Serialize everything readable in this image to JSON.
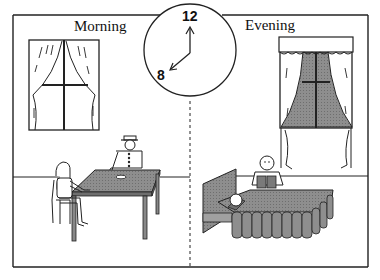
{
  "panels": {
    "left": {
      "label": "Morning"
    },
    "right": {
      "label": "Evening"
    }
  },
  "clock": {
    "numbers": {
      "top": "12",
      "left": "8"
    },
    "time_shown": "8:00"
  },
  "colors": {
    "line": "#222222",
    "shade": "#8a8a8a",
    "shade_light": "#b5b5b5",
    "background": "#ffffff"
  }
}
